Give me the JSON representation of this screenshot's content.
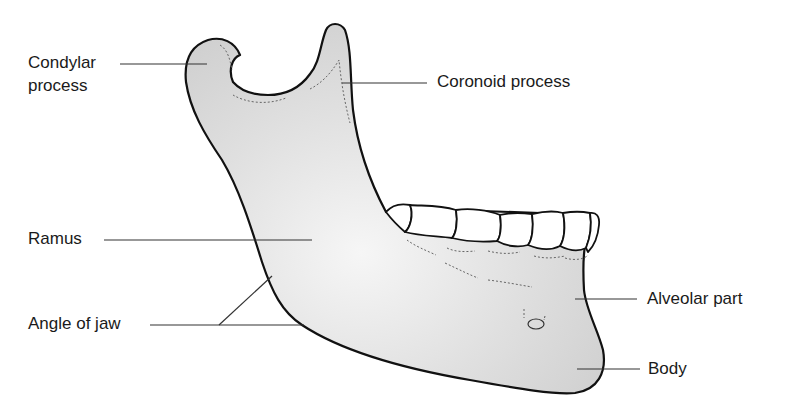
{
  "diagram": {
    "colors": {
      "bone_fill": "#d6d6d6",
      "bone_highlight": "#f4f4f4",
      "outline": "#111111",
      "leader_line": "#333333",
      "teeth_fill": "#ffffff",
      "text": "#1a1a1a"
    },
    "labels": {
      "condylar_line1": "Condylar",
      "condylar_line2": "process",
      "coronoid": "Coronoid process",
      "ramus": "Ramus",
      "angle": "Angle of jaw",
      "alveolar": "Alveolar part",
      "body": "Body"
    }
  }
}
